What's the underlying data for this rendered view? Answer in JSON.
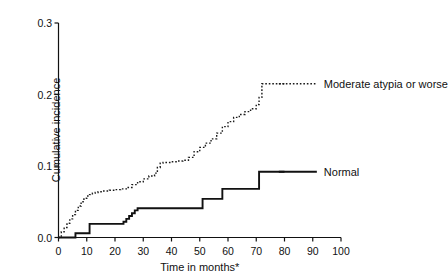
{
  "chart_data": {
    "type": "line",
    "title": "",
    "subtitle": "",
    "xlabel": "Time in months*",
    "ylabel": "Cumulative incidence",
    "xlim": [
      0,
      100
    ],
    "ylim": [
      0.0,
      0.3
    ],
    "xticks": [
      0,
      10,
      20,
      30,
      40,
      50,
      60,
      70,
      80,
      90,
      100
    ],
    "xtick_labels": [
      "0",
      "10",
      "20",
      "30",
      "40",
      "50",
      "60",
      "70",
      "80",
      "90",
      "100"
    ],
    "yticks": [
      0.0,
      0.1,
      0.2,
      0.3
    ],
    "ytick_labels": [
      "0.0",
      "0.1",
      "0.2",
      "0.3"
    ],
    "grid": false,
    "legend_position": "inline-right",
    "step_type": "post",
    "series": [
      {
        "name": "Moderate atypia or worse",
        "label": "Moderate atypia or worse",
        "style": "dotted",
        "color": "#1a1a1a",
        "label_x": 78,
        "label_y": 0.215,
        "x": [
          0,
          1,
          2,
          3,
          4,
          5,
          6,
          7,
          8,
          9,
          10,
          11,
          12,
          13,
          14,
          16,
          18,
          20,
          22,
          24,
          26,
          28,
          30,
          32,
          34,
          35,
          36,
          37,
          38,
          40,
          42,
          44,
          46,
          48,
          50,
          52,
          54,
          56,
          58,
          60,
          62,
          64,
          66,
          68,
          70,
          71,
          72,
          74,
          76,
          78,
          80
        ],
        "y": [
          0.0,
          0.008,
          0.014,
          0.02,
          0.026,
          0.032,
          0.038,
          0.044,
          0.05,
          0.055,
          0.058,
          0.06,
          0.062,
          0.063,
          0.064,
          0.065,
          0.066,
          0.067,
          0.068,
          0.07,
          0.074,
          0.078,
          0.082,
          0.086,
          0.09,
          0.098,
          0.104,
          0.105,
          0.105,
          0.106,
          0.107,
          0.108,
          0.112,
          0.12,
          0.126,
          0.132,
          0.138,
          0.146,
          0.155,
          0.162,
          0.168,
          0.172,
          0.176,
          0.18,
          0.186,
          0.196,
          0.215,
          0.215,
          0.215,
          0.215,
          0.215
        ]
      },
      {
        "name": "Normal",
        "label": "Normal",
        "style": "solid",
        "color": "#111111",
        "label_x": 78,
        "label_y": 0.092,
        "x": [
          0,
          5,
          6,
          10,
          11,
          22,
          23,
          24,
          25,
          26,
          27,
          28,
          50,
          51,
          57,
          58,
          70,
          71,
          72,
          80
        ],
        "y": [
          0.0,
          0.0,
          0.006,
          0.006,
          0.019,
          0.019,
          0.022,
          0.026,
          0.03,
          0.034,
          0.038,
          0.041,
          0.041,
          0.054,
          0.054,
          0.068,
          0.068,
          0.092,
          0.092,
          0.092
        ]
      }
    ]
  },
  "axis": {
    "y_axis_name": "y-axis",
    "x_axis_name": "x-axis"
  }
}
